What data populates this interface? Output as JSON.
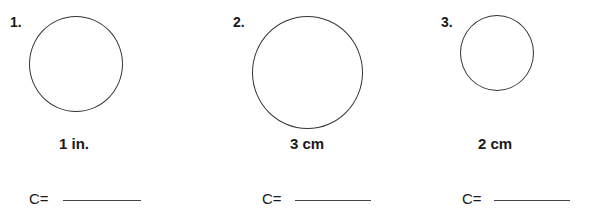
{
  "worksheet": {
    "problems": [
      {
        "number": "1.",
        "measurement": "1 in.",
        "answer_label": "C=",
        "answer_value": ""
      },
      {
        "number": "2.",
        "measurement": "3 cm",
        "answer_label": "C=",
        "answer_value": ""
      },
      {
        "number": "3.",
        "measurement": "2 cm",
        "answer_label": "C=",
        "answer_value": ""
      }
    ]
  }
}
